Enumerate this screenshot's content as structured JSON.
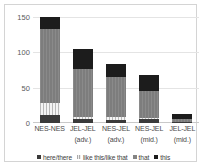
{
  "chart_data": {
    "type": "bar",
    "stacked": true,
    "title": "",
    "xlabel": "",
    "ylabel": "",
    "ylim": [
      0,
      150
    ],
    "yticks": [
      0,
      50,
      100,
      150
    ],
    "ytick_labels": [
      "0",
      "50",
      "100",
      "150"
    ],
    "grid": true,
    "legend_position": "bottom",
    "categories": [
      "NES-NES",
      "JEL-JEL (adv.)",
      "NES-JEL (adv.)",
      "NES-JEL (mid.)",
      "JEL-JEL (mid.)"
    ],
    "category_lines": [
      {
        "l1": "NES-NES",
        "l2": ""
      },
      {
        "l1": "JEL-JEL",
        "l2": "(adv.)"
      },
      {
        "l1": "NES-JEL",
        "l2": "(adv.)"
      },
      {
        "l1": "NES-JEL",
        "l2": "(mid.)"
      },
      {
        "l1": "JEL-JEL",
        "l2": "(mid.)"
      }
    ],
    "series": [
      {
        "name": "here/there",
        "color": "#3a3a3a",
        "values": [
          11,
          5,
          4,
          5,
          1
        ]
      },
      {
        "name": "like this/like that",
        "color": "#e8e8e8",
        "values": [
          17,
          3,
          4,
          2,
          0
        ]
      },
      {
        "name": "that",
        "color": "#848484",
        "values": [
          105,
          69,
          57,
          39,
          4
        ]
      },
      {
        "name": "this",
        "color": "#1c1c1c",
        "values": [
          17,
          28,
          18,
          22,
          8
        ]
      }
    ],
    "totals": [
      150,
      105,
      83,
      68,
      13
    ]
  },
  "legend": {
    "items": [
      {
        "label": "here/there"
      },
      {
        "label": "like this/like that"
      },
      {
        "label": "that"
      },
      {
        "label": "this"
      }
    ]
  }
}
